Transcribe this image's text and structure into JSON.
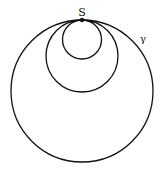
{
  "diagram": {
    "point_label": "S",
    "curve_label": "γ",
    "stroke_color": "#111111",
    "circles": [
      {
        "name": "large",
        "cx": 82,
        "cy": 91,
        "r": 71
      },
      {
        "name": "medium",
        "cx": 82,
        "cy": 56,
        "r": 36
      },
      {
        "name": "small",
        "cx": 82,
        "cy": 39,
        "r": 19.5
      }
    ],
    "tangent_point": {
      "x": 82,
      "y": 20
    }
  }
}
